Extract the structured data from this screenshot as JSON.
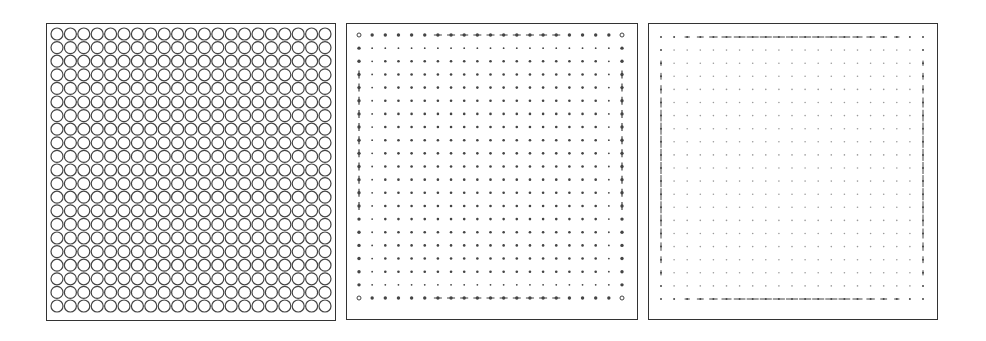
{
  "figure": {
    "grid": {
      "rows": 21,
      "cols": 21
    },
    "colors": {
      "stroke": "#444444",
      "border": "#333333",
      "faint": "#9a9a9a",
      "background": "#ffffff"
    }
  },
  "panels": [
    {
      "id": "circles",
      "label": "",
      "left": 46,
      "top": 23,
      "width": 290,
      "height": 298,
      "style": "circles"
    },
    {
      "id": "dots",
      "label": "",
      "left": 346,
      "top": 23,
      "width": 292,
      "height": 297,
      "style": "dots"
    },
    {
      "id": "faint-dots",
      "label": "",
      "left": 648,
      "top": 23,
      "width": 290,
      "height": 297,
      "style": "faint"
    }
  ]
}
